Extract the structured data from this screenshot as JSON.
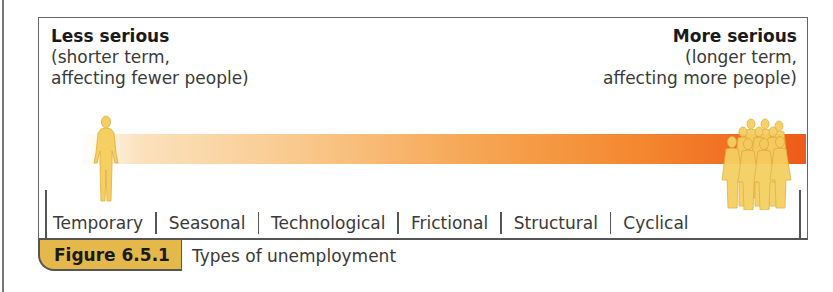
{
  "left_label": {
    "title": "Less serious",
    "line1": "(shorter term,",
    "line2": "affecting fewer people)"
  },
  "right_label": {
    "title": "More serious",
    "line1": "(longer term,",
    "line2": "affecting more people)"
  },
  "scale": {
    "gradient_colors": [
      "#ffffff",
      "#fbe2bd",
      "#f6a552",
      "#ee5a1a"
    ],
    "types": [
      "Temporary",
      "Seasonal",
      "Technological",
      "Frictional",
      "Structural",
      "Cyclical"
    ]
  },
  "icons": {
    "left": "single-person-icon",
    "right": "crowd-of-people-icon"
  },
  "caption": {
    "figure_number": "Figure 6.5.1",
    "text": "Types of unemployment",
    "tag_color": "#e4b84a"
  }
}
